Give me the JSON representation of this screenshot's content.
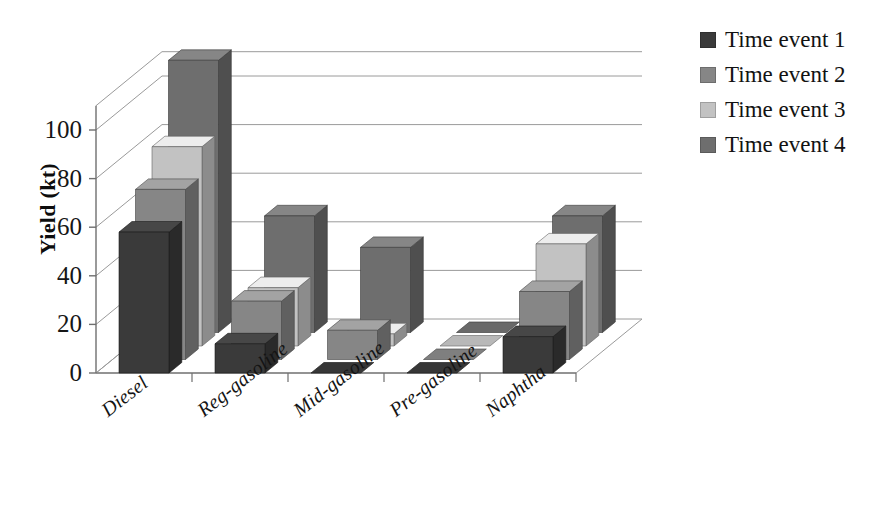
{
  "chart_data": {
    "type": "bar",
    "subtype": "3d-grouped-column",
    "title": "",
    "xlabel": "",
    "ylabel": "Yield  (kt)",
    "ylim": [
      0,
      110
    ],
    "yticks": [
      0,
      20,
      40,
      60,
      80,
      100
    ],
    "grid": true,
    "legend_position": "right",
    "categories": [
      "Diesel",
      "Reg-gasoline",
      "Mid-gasoline",
      "Pre-gasoline",
      "Naphtha"
    ],
    "series": [
      {
        "name": "Time event 1",
        "color": "#3a3a3a",
        "values": [
          58,
          12,
          0,
          0,
          15
        ]
      },
      {
        "name": "Time event 2",
        "color": "#868686",
        "values": [
          70,
          24,
          12,
          0,
          28
        ]
      },
      {
        "name": "Time event 3",
        "color": "#c2c2c2",
        "values": [
          82,
          24,
          5,
          0,
          42
        ]
      },
      {
        "name": "Time event 4",
        "color": "#6e6e6e",
        "values": [
          112,
          48,
          35,
          0,
          48
        ]
      }
    ]
  },
  "axis": {
    "tick_labels": [
      "100",
      "80",
      "60",
      "40",
      "20",
      "0"
    ],
    "y_title": "Yield  (kt)"
  },
  "categories": [
    {
      "label": "Diesel"
    },
    {
      "label": "Reg-gasoline"
    },
    {
      "label": "Mid-gasoline"
    },
    {
      "label": "Pre-gasoline"
    },
    {
      "label": "Naphtha"
    }
  ],
  "legend": {
    "items": [
      {
        "label": "Time event 1",
        "color": "#3a3a3a"
      },
      {
        "label": "Time event 2",
        "color": "#868686"
      },
      {
        "label": "Time event 3",
        "color": "#c2c2c2"
      },
      {
        "label": "Time event 4",
        "color": "#6e6e6e"
      }
    ]
  },
  "colors": {
    "series_1": "#3a3a3a",
    "series_2": "#868686",
    "series_3": "#c2c2c2",
    "series_4": "#6e6e6e",
    "grid": "#9a9a9a",
    "axis": "#6f6f6f",
    "text": "#121212"
  }
}
